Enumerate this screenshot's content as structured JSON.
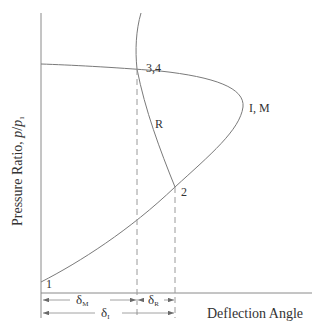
{
  "diagram": {
    "axes": {
      "y_label_prefix": "Pressure Ratio, ",
      "y_label_var": "p",
      "y_label_slash": "/",
      "y_label_var2": "p",
      "y_label_sub": "1",
      "x_label": "Deflection Angle"
    },
    "points": {
      "p1": "1",
      "p34": "3,4",
      "pIM": "I, M",
      "p2": "2",
      "pR": "R"
    },
    "dimensions": {
      "delta_M": {
        "symbol": "δ",
        "sub": "M"
      },
      "delta_R": {
        "symbol": "δ",
        "sub": "R"
      },
      "delta_I": {
        "symbol": "δ",
        "sub": "I"
      }
    },
    "colors": {
      "curve": "#7a7a7a",
      "axis": "#8a8a8a",
      "text": "#333333"
    }
  }
}
